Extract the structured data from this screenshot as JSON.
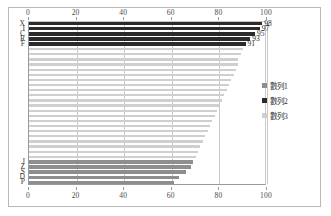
{
  "chart_data": {
    "type": "bar",
    "orientation": "horizontal",
    "title": "",
    "xlabel": "",
    "ylabel": "",
    "xlim": [
      0,
      100
    ],
    "xticks": [
      0,
      20,
      40,
      60,
      80,
      100
    ],
    "top_axis_ticks": [
      "0",
      "20",
      "40",
      "60",
      "80",
      "100"
    ],
    "bottom_axis_ticks": [
      "0",
      "20",
      "40",
      "60",
      "80",
      "100"
    ],
    "grid": true,
    "legend_position": "right",
    "legend": [
      {
        "label": "數列1",
        "color": "#8e8e8e"
      },
      {
        "label": "數列2",
        "color": "#2b2b2b"
      },
      {
        "label": "數列3",
        "color": "#cfcfcf"
      }
    ],
    "visible_category_labels": [
      "X",
      "I",
      "C",
      "R",
      "F",
      "J",
      "Z",
      "S",
      "D",
      "P"
    ],
    "bars": [
      {
        "category": "X",
        "value": 98,
        "series": "數列2",
        "label": "98"
      },
      {
        "category": "I",
        "value": 97,
        "series": "數列2",
        "label": "97"
      },
      {
        "category": "C",
        "value": 95,
        "series": "數列2",
        "label": "95"
      },
      {
        "category": "R",
        "value": 93,
        "series": "數列2",
        "label": "93"
      },
      {
        "category": "F",
        "value": 91,
        "series": "數列2",
        "label": "91"
      },
      {
        "category": "",
        "value": 90,
        "series": "數列3",
        "label": ""
      },
      {
        "category": "",
        "value": 89,
        "series": "數列3",
        "label": ""
      },
      {
        "category": "",
        "value": 88,
        "series": "數列3",
        "label": ""
      },
      {
        "category": "",
        "value": 88,
        "series": "數列3",
        "label": ""
      },
      {
        "category": "",
        "value": 87,
        "series": "數列3",
        "label": ""
      },
      {
        "category": "",
        "value": 86,
        "series": "數列3",
        "label": ""
      },
      {
        "category": "",
        "value": 85,
        "series": "數列3",
        "label": ""
      },
      {
        "category": "",
        "value": 84,
        "series": "數列3",
        "label": ""
      },
      {
        "category": "",
        "value": 83,
        "series": "數列3",
        "label": ""
      },
      {
        "category": "",
        "value": 82,
        "series": "數列3",
        "label": ""
      },
      {
        "category": "",
        "value": 81,
        "series": "數列3",
        "label": ""
      },
      {
        "category": "",
        "value": 80,
        "series": "數列3",
        "label": ""
      },
      {
        "category": "",
        "value": 79,
        "series": "數列3",
        "label": ""
      },
      {
        "category": "",
        "value": 78,
        "series": "數列3",
        "label": ""
      },
      {
        "category": "",
        "value": 77,
        "series": "數列3",
        "label": ""
      },
      {
        "category": "",
        "value": 76,
        "series": "數列3",
        "label": ""
      },
      {
        "category": "",
        "value": 75,
        "series": "數列3",
        "label": ""
      },
      {
        "category": "",
        "value": 74,
        "series": "數列3",
        "label": ""
      },
      {
        "category": "",
        "value": 73,
        "series": "數列3",
        "label": ""
      },
      {
        "category": "",
        "value": 72,
        "series": "數列3",
        "label": ""
      },
      {
        "category": "",
        "value": 71,
        "series": "數列3",
        "label": ""
      },
      {
        "category": "",
        "value": 70,
        "series": "數列3",
        "label": ""
      },
      {
        "category": "J",
        "value": 69,
        "series": "數列1",
        "label": ""
      },
      {
        "category": "Z",
        "value": 68,
        "series": "數列1",
        "label": ""
      },
      {
        "category": "S",
        "value": 66,
        "series": "數列1",
        "label": ""
      },
      {
        "category": "D",
        "value": 63,
        "series": "數列1",
        "label": ""
      },
      {
        "category": "P",
        "value": 61,
        "series": "數列1",
        "label": ""
      }
    ]
  }
}
